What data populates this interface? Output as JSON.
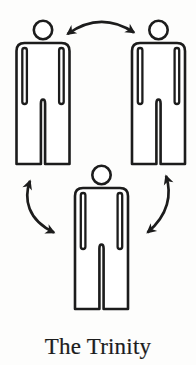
{
  "figure": {
    "caption": "The Trinity",
    "ink_color": "#1c1c1c",
    "background_color": "#fdfdfc",
    "persons": [
      {
        "id": "person-top-left",
        "icon": "person-outline-icon",
        "position": "top-left"
      },
      {
        "id": "person-top-right",
        "icon": "person-outline-icon",
        "position": "top-right"
      },
      {
        "id": "person-bottom-center",
        "icon": "person-outline-icon",
        "position": "bottom-center"
      }
    ],
    "arrows": [
      {
        "id": "arrow-top",
        "icon": "curved-double-arrow-icon",
        "connects": "top-left person and top-right person"
      },
      {
        "id": "arrow-left",
        "icon": "curved-double-arrow-icon",
        "connects": "top-left person and bottom-center person"
      },
      {
        "id": "arrow-right",
        "icon": "curved-double-arrow-icon",
        "connects": "top-right person and bottom-center person"
      }
    ]
  }
}
